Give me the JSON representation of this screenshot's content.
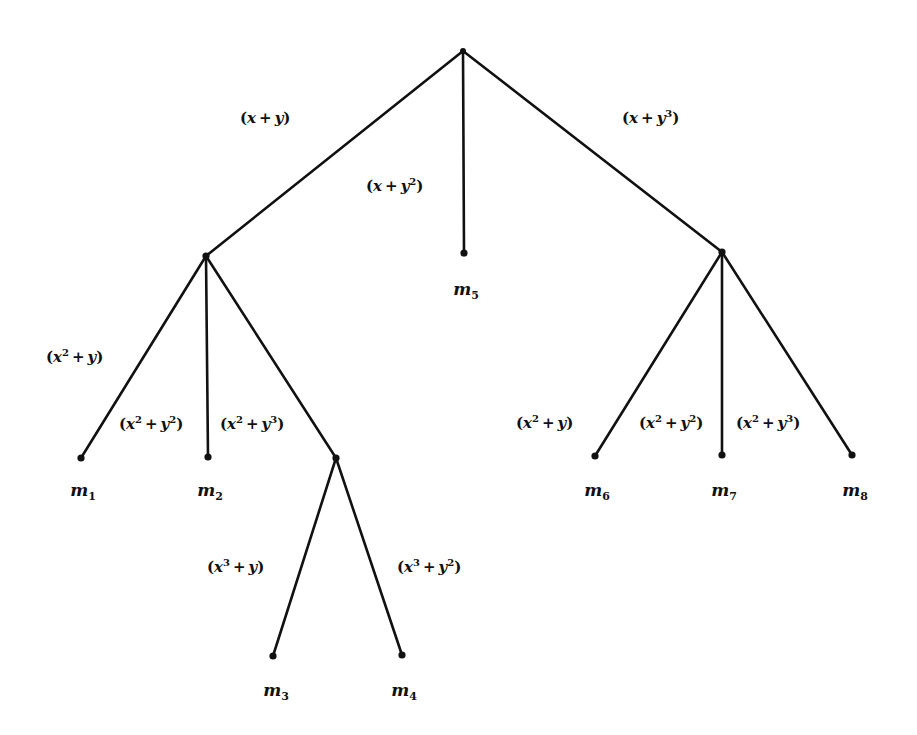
{
  "diagram": {
    "type": "tree",
    "nodes": [
      {
        "id": "root",
        "x": 463,
        "y": 51
      },
      {
        "id": "n1",
        "x": 206,
        "y": 256
      },
      {
        "id": "n3",
        "x": 722,
        "y": 252
      },
      {
        "id": "n13",
        "x": 336,
        "y": 458
      },
      {
        "id": "m1",
        "x": 81,
        "y": 458,
        "label_base": "m",
        "label_sub": "1"
      },
      {
        "id": "m2",
        "x": 208,
        "y": 457,
        "label_base": "m",
        "label_sub": "2"
      },
      {
        "id": "m3",
        "x": 273,
        "y": 656,
        "label_base": "m",
        "label_sub": "3"
      },
      {
        "id": "m4",
        "x": 402,
        "y": 655,
        "label_base": "m",
        "label_sub": "4"
      },
      {
        "id": "m5",
        "x": 464,
        "y": 253,
        "label_base": "m",
        "label_sub": "5"
      },
      {
        "id": "m6",
        "x": 595,
        "y": 456,
        "label_base": "m",
        "label_sub": "6"
      },
      {
        "id": "m7",
        "x": 722,
        "y": 455,
        "label_base": "m",
        "label_sub": "7"
      },
      {
        "id": "m8",
        "x": 852,
        "y": 455,
        "label_base": "m",
        "label_sub": "8"
      }
    ],
    "edges": [
      {
        "from": "root",
        "to": "n1",
        "label": "(x + y)",
        "x_exp": "",
        "y_exp": ""
      },
      {
        "from": "root",
        "to": "m5",
        "label": "(x + y^2)",
        "x_exp": "",
        "y_exp": "2"
      },
      {
        "from": "root",
        "to": "n3",
        "label": "(x + y^3)",
        "x_exp": "",
        "y_exp": "3"
      },
      {
        "from": "n1",
        "to": "m1",
        "label": "(x^2 + y)",
        "x_exp": "2",
        "y_exp": ""
      },
      {
        "from": "n1",
        "to": "m2",
        "label": "(x^2 + y^2)",
        "x_exp": "2",
        "y_exp": "2"
      },
      {
        "from": "n1",
        "to": "n13",
        "label": "(x^2 + y^3)",
        "x_exp": "2",
        "y_exp": "3"
      },
      {
        "from": "n13",
        "to": "m3",
        "label": "(x^3 + y)",
        "x_exp": "3",
        "y_exp": ""
      },
      {
        "from": "n13",
        "to": "m4",
        "label": "(x^3 + y^2)",
        "x_exp": "3",
        "y_exp": "2"
      },
      {
        "from": "n3",
        "to": "m6",
        "label": "(x^2 + y)",
        "x_exp": "2",
        "y_exp": ""
      },
      {
        "from": "n3",
        "to": "m7",
        "label": "(x^2 + y^2)",
        "x_exp": "2",
        "y_exp": "2"
      },
      {
        "from": "n3",
        "to": "m8",
        "label": "(x^2 + y^3)",
        "x_exp": "2",
        "y_exp": "3"
      }
    ],
    "edge_labels": [
      {
        "text": "(x + y)",
        "x_exp": "",
        "y_exp": "",
        "left": 240,
        "top": 111
      },
      {
        "text": "(x + y^2)",
        "x_exp": "",
        "y_exp": "2",
        "left": 366,
        "top": 179
      },
      {
        "text": "(x + y^3)",
        "x_exp": "",
        "y_exp": "3",
        "left": 622,
        "top": 111
      },
      {
        "text": "(x^2 + y)",
        "x_exp": "2",
        "y_exp": "",
        "left": 46,
        "top": 350
      },
      {
        "text": "(x^2 + y^2)",
        "x_exp": "2",
        "y_exp": "2",
        "left": 119,
        "top": 417
      },
      {
        "text": "(x^2 + y^3)",
        "x_exp": "2",
        "y_exp": "3",
        "left": 220,
        "top": 417
      },
      {
        "text": "(x^3 + y)",
        "x_exp": "3",
        "y_exp": "",
        "left": 207,
        "top": 560
      },
      {
        "text": "(x^3 + y^2)",
        "x_exp": "3",
        "y_exp": "2",
        "left": 397,
        "top": 560
      },
      {
        "text": "(x^2 + y)",
        "x_exp": "2",
        "y_exp": "",
        "left": 516,
        "top": 416
      },
      {
        "text": "(x^2 + y^2)",
        "x_exp": "2",
        "y_exp": "2",
        "left": 639,
        "top": 416
      },
      {
        "text": "(x^2 + y^3)",
        "x_exp": "2",
        "y_exp": "3",
        "left": 736,
        "top": 416
      }
    ],
    "leaf_labels": [
      {
        "base": "m",
        "sub": "1",
        "cx": 83,
        "top": 482
      },
      {
        "base": "m",
        "sub": "2",
        "cx": 210,
        "top": 482
      },
      {
        "base": "m",
        "sub": "3",
        "cx": 276,
        "top": 682
      },
      {
        "base": "m",
        "sub": "4",
        "cx": 404,
        "top": 682
      },
      {
        "base": "m",
        "sub": "5",
        "cx": 466,
        "top": 281
      },
      {
        "base": "m",
        "sub": "6",
        "cx": 597,
        "top": 482
      },
      {
        "base": "m",
        "sub": "7",
        "cx": 724,
        "top": 482
      },
      {
        "base": "m",
        "sub": "8",
        "cx": 855,
        "top": 482
      }
    ],
    "colors": {
      "ink": "#111111",
      "background": "#ffffff"
    }
  }
}
